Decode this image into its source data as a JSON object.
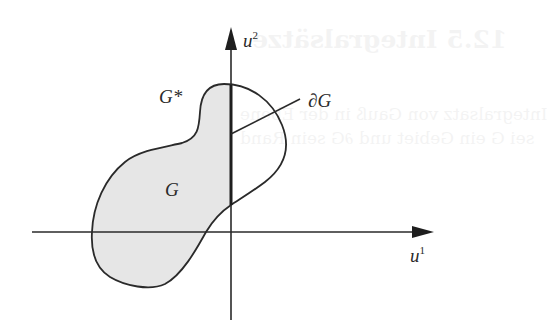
{
  "figure": {
    "axes": {
      "x_label": "u",
      "x_label_sup": "1",
      "y_label": "u",
      "y_label_sup": "2"
    },
    "labels": {
      "region": "G",
      "subregion": "G*",
      "boundary": "∂G"
    },
    "colors": {
      "line": "#2a2a2a",
      "fill": "#e6e6e6",
      "background": "#ffffff"
    }
  },
  "ghost_text": {
    "heading": "12.5 Integralsätze",
    "line1": "Integralsatz von Gauß in der Ebene",
    "line2": "sei G ein Gebiet und ∂G sein Rand"
  }
}
